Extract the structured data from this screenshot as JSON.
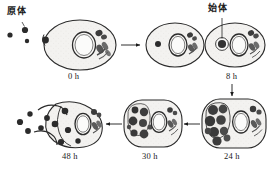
{
  "figure": {
    "type": "cycle-diagram",
    "background_color": "#ffffff",
    "ink_color": "#1a1a1a",
    "body_fill": "#3a3a3a",
    "cytoplasm_fill": "#f2f1ef"
  },
  "annotations": {
    "elementary_body_label": "原体",
    "initial_body_label": "始体"
  },
  "stages": [
    {
      "id": "stage-0h",
      "time_label": "0 h",
      "description": "Elementary body attaching to host cell surface",
      "inclusion_count": 0
    },
    {
      "id": "stage-intermediate",
      "time_label": "",
      "description": "Elementary body internalized into host cell",
      "inclusion_count": 1
    },
    {
      "id": "stage-8h",
      "time_label": "8 h",
      "description": "Initial body (reticulate body) within inclusion vacuole",
      "inclusion_count": 1
    },
    {
      "id": "stage-24h",
      "time_label": "24 h",
      "description": "Inclusion filled with dividing reticulate bodies",
      "inclusion_count": 9
    },
    {
      "id": "stage-30h",
      "time_label": "30 h",
      "description": "Reticulate bodies condensing into elementary bodies",
      "inclusion_count": 8
    },
    {
      "id": "stage-48h",
      "time_label": "48 h",
      "description": "Host cell lysis releasing elementary bodies",
      "inclusion_count": 7
    }
  ],
  "free_particles": {
    "top_left_count": 3,
    "bottom_left_count": 3
  },
  "arrows": [
    {
      "id": "arrow-0h-to-mid",
      "direction": "right"
    },
    {
      "id": "arrow-mid-to-8h",
      "direction": "right"
    },
    {
      "id": "arrow-8h-to-24h",
      "direction": "down"
    },
    {
      "id": "arrow-24h-to-30h",
      "direction": "left"
    },
    {
      "id": "arrow-30h-to-48h",
      "direction": "left"
    }
  ]
}
